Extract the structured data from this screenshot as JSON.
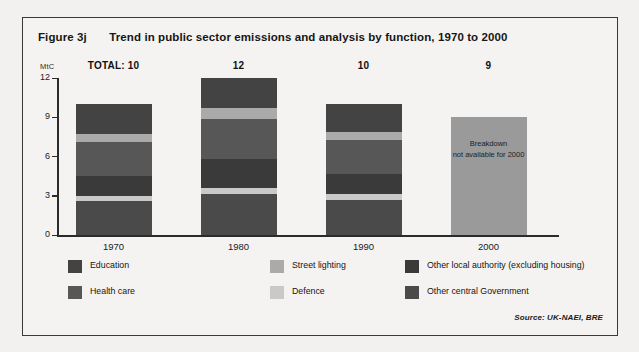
{
  "figure": {
    "number": "Figure 3j",
    "title": "Trend in public sector emissions and analysis by function, 1970 to 2000",
    "source": "Source: UK-NAEI, BRE"
  },
  "chart_data": {
    "type": "bar",
    "subtype": "stacked",
    "title": "Trend in public sector emissions and analysis by function, 1970 to 2000",
    "xlabel": "",
    "ylabel": "MtC",
    "ylim": [
      0,
      12
    ],
    "yticks": [
      0,
      3,
      6,
      9,
      12
    ],
    "grid": false,
    "legend_position": "bottom",
    "categories": [
      "1970",
      "1980",
      "1990",
      "2000"
    ],
    "totals": [
      10,
      12,
      10,
      9
    ],
    "total_labels": [
      "TOTAL: 10",
      "12",
      "10",
      "9"
    ],
    "series": [
      {
        "name": "Other central Government",
        "color": "#4a4a4a",
        "values": [
          2.6,
          3.1,
          2.7,
          null
        ]
      },
      {
        "name": "Defence",
        "color": "#c9c9c9",
        "values": [
          0.4,
          0.5,
          0.4,
          null
        ]
      },
      {
        "name": "Other local authority (excluding housing)",
        "color": "#3a3a3a",
        "values": [
          1.5,
          2.2,
          1.6,
          null
        ]
      },
      {
        "name": "Health care",
        "color": "#575757",
        "values": [
          2.6,
          3.1,
          2.6,
          null
        ]
      },
      {
        "name": "Street lighting",
        "color": "#aaaaaa",
        "values": [
          0.6,
          0.8,
          0.6,
          null
        ]
      },
      {
        "name": "Education",
        "color": "#434343",
        "values": [
          2.3,
          2.3,
          2.1,
          null
        ]
      }
    ],
    "no_breakdown": {
      "category": "2000",
      "value": 9,
      "color": "#9a9a9a",
      "label_line1": "Breakdown",
      "label_line2": "not available for 2000"
    },
    "annotations": [
      "Breakdown not available for 2000"
    ]
  },
  "legend": {
    "items": [
      {
        "label": "Education",
        "color": "#434343",
        "col": 0,
        "row": 0
      },
      {
        "label": "Health care",
        "color": "#575757",
        "col": 0,
        "row": 1
      },
      {
        "label": "Street lighting",
        "color": "#aaaaaa",
        "col": 1,
        "row": 0
      },
      {
        "label": "Defence",
        "color": "#c9c9c9",
        "col": 1,
        "row": 1
      },
      {
        "label": "Other local authority (excluding housing)",
        "color": "#3a3a3a",
        "col": 2,
        "row": 0
      },
      {
        "label": "Other central Government",
        "color": "#4a4a4a",
        "col": 2,
        "row": 1
      }
    ]
  }
}
